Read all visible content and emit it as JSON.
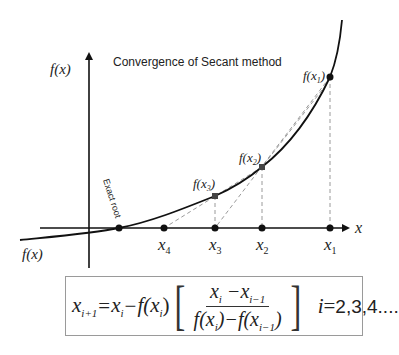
{
  "diagram": {
    "title": "Convergence of Secant method",
    "y_axis_label": "f(x)",
    "x_axis_label": "x",
    "curve_label": "f(x)",
    "exact_root_label": "Exact root",
    "points": [
      {
        "name": "x1",
        "label_x": "x",
        "label_sub": "1",
        "f_label": "f(x",
        "f_sub": "1",
        "x": 330,
        "y": 77
      },
      {
        "name": "x2",
        "label_x": "x",
        "label_sub": "2",
        "f_label": "f(x",
        "f_sub": "2",
        "x": 262,
        "y": 167
      },
      {
        "name": "x3",
        "label_x": "x",
        "label_sub": "3",
        "f_label": "f(x",
        "f_sub": "3",
        "x": 215,
        "y": 196
      },
      {
        "name": "x4",
        "label_x": "x",
        "label_sub": "4",
        "x": 164,
        "y": 228
      }
    ],
    "colors": {
      "curve": "#111111",
      "axes": "#111111",
      "dashed": "#9a9a9a",
      "box_border": "#9a9a9a"
    }
  },
  "formula": {
    "lhs_var": "x",
    "lhs_sub": "i+1",
    "eq": "=",
    "xi": "x",
    "xi_sub": "i",
    "minus": "−",
    "f_open": "f(x",
    "f_sub": "i",
    "f_close": ")",
    "bracket_open": "[",
    "bracket_close": "]",
    "num_a": "x",
    "num_a_sub": "i",
    "num_minus": " −x",
    "num_b_sub": "i−1",
    "den_a": "f(x",
    "den_a_sub": "i",
    "den_mid": ")−f(x",
    "den_b_sub": "i−1",
    "den_close": ")",
    "iter_var": "i",
    "iter_eq": "=",
    "iter_values": "2,3,4...."
  }
}
